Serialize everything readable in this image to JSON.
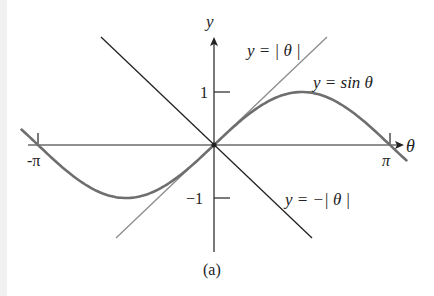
{
  "figure": {
    "caption": "(a)",
    "axes": {
      "x_label": "θ",
      "y_label": "y",
      "x_ticks": [
        "-π",
        "π"
      ],
      "y_ticks": [
        "1",
        "−1"
      ]
    },
    "curves": [
      {
        "name": "sin",
        "label": "y = sin θ",
        "color": "#6e6e6e"
      },
      {
        "name": "abs",
        "label": "y = | θ |",
        "color": "#8c8c8c"
      },
      {
        "name": "negabs",
        "label": "y = −| θ |",
        "color": "#222222"
      }
    ]
  },
  "chart_data": {
    "type": "line",
    "title": "",
    "xlabel": "θ",
    "ylabel": "y",
    "xlim": [
      -3.14159,
      3.14159
    ],
    "ylim": [
      -1.8,
      1.8
    ],
    "grid": false,
    "series": [
      {
        "name": "y = sin θ",
        "x": [
          -3.14159,
          -2.356,
          -1.5708,
          -0.785,
          0,
          0.785,
          1.5708,
          2.356,
          3.14159
        ],
        "values": [
          0,
          -0.707,
          -1,
          -0.707,
          0,
          0.707,
          1,
          0.707,
          0
        ]
      },
      {
        "name": "y = |θ|",
        "x": [
          -1.7,
          0,
          1.7
        ],
        "values": [
          1.7,
          0,
          1.7
        ]
      },
      {
        "name": "y = −|θ|",
        "x": [
          -1.7,
          0,
          1.7
        ],
        "values": [
          -1.7,
          0,
          -1.7
        ]
      }
    ],
    "annotations": [
      "y = |θ|",
      "y = sin θ",
      "y = −|θ|",
      "(a)"
    ]
  }
}
